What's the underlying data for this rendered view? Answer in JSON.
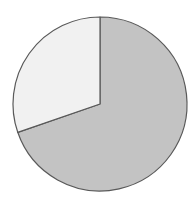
{
  "chart_data": {
    "type": "pie",
    "title": "",
    "subtitle": "",
    "xlabel": "",
    "ylabel": "",
    "grid": false,
    "legend": "none",
    "start_angle_deg": 0,
    "direction": "clockwise",
    "center": {
      "x": 100,
      "y": 104
    },
    "radius": 87,
    "categories": [
      "Slice 1",
      "Slice 2"
    ],
    "values": [
      70,
      30
    ],
    "percentages": [
      "70%",
      "30%"
    ],
    "angles_deg": [
      251,
      109
    ],
    "colors": [
      "#c3c3c3",
      "#f1f1f1"
    ],
    "stroke_color": "#595959",
    "background_color": "#ffffff",
    "slices": [
      {
        "label": "Slice 1",
        "value": 70,
        "percent": "70%",
        "angle_deg": 251,
        "color": "#c3c3c3",
        "start_deg": 0,
        "end_deg": 251
      },
      {
        "label": "Slice 2",
        "value": 30,
        "percent": "30%",
        "angle_deg": 109,
        "color": "#f1f1f1",
        "start_deg": 251,
        "end_deg": 360
      }
    ]
  },
  "figure": {
    "width": 195,
    "height": 211
  }
}
